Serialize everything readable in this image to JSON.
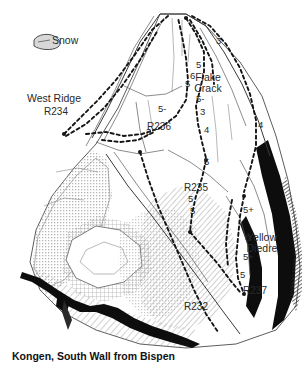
{
  "figure": {
    "caption": "Kongen, South Wall from Bispen",
    "type": "climbing-route-topo"
  },
  "legend": {
    "snow_label": "Snow",
    "snow_icon": "snow-patch-icon"
  },
  "named_features": [
    {
      "id": "west-ridge",
      "label": "West Ridge",
      "x": 54,
      "y": 99
    },
    {
      "id": "flake-crack-1",
      "label": "Flake",
      "x": 208,
      "y": 78
    },
    {
      "id": "flake-crack-2",
      "label": "Crack",
      "x": 208,
      "y": 89
    },
    {
      "id": "yellow-1",
      "label": "Yellow",
      "x": 262,
      "y": 238
    },
    {
      "id": "yellow-2",
      "label": "Diedre",
      "x": 262,
      "y": 249
    }
  ],
  "route_markers": [
    {
      "id": "R234",
      "label": "R234",
      "x": 56,
      "y": 112
    },
    {
      "id": "R236",
      "label": "R236",
      "x": 159,
      "y": 127
    },
    {
      "id": "R235",
      "label": "R235",
      "x": 196,
      "y": 188
    },
    {
      "id": "R232",
      "label": "R232",
      "x": 196,
      "y": 307
    },
    {
      "id": "R237",
      "label": "R237",
      "x": 255,
      "y": 291
    }
  ],
  "pitch_grades": [
    {
      "id": "g-top-3",
      "grade": "3",
      "x": 216,
      "y": 41
    },
    {
      "id": "g-5a",
      "grade": "5",
      "x": 196,
      "y": 65
    },
    {
      "id": "g-6a",
      "grade": "6",
      "x": 190,
      "y": 76
    },
    {
      "id": "g-5b",
      "grade": "5",
      "x": 185,
      "y": 84
    },
    {
      "id": "g-5minus-a",
      "grade": "5-",
      "x": 196,
      "y": 99
    },
    {
      "id": "g-3a",
      "grade": "3",
      "x": 200,
      "y": 112
    },
    {
      "id": "g-5minus-b",
      "grade": "5-",
      "x": 158,
      "y": 109
    },
    {
      "id": "g-3b",
      "grade": "3",
      "x": 146,
      "y": 132
    },
    {
      "id": "g-4a",
      "grade": "4",
      "x": 204,
      "y": 130
    },
    {
      "id": "g-4b",
      "grade": "4",
      "x": 258,
      "y": 125
    },
    {
      "id": "g-5c",
      "grade": "5",
      "x": 204,
      "y": 162
    },
    {
      "id": "g-5d",
      "grade": "5",
      "x": 188,
      "y": 199
    },
    {
      "id": "g-5e",
      "grade": "5",
      "x": 190,
      "y": 211
    },
    {
      "id": "g-5plus-a",
      "grade": "5+",
      "x": 243,
      "y": 210
    },
    {
      "id": "g-6b",
      "grade": "6",
      "x": 245,
      "y": 238
    },
    {
      "id": "g-5plus-b",
      "grade": "5+",
      "x": 243,
      "y": 257
    },
    {
      "id": "g-5f",
      "grade": "5",
      "x": 240,
      "y": 275
    }
  ],
  "colors": {
    "ink": "#141414",
    "paper": "#ffffff",
    "rock_shade": "#9a9a9a",
    "dark_band": "#0d0d0d"
  }
}
